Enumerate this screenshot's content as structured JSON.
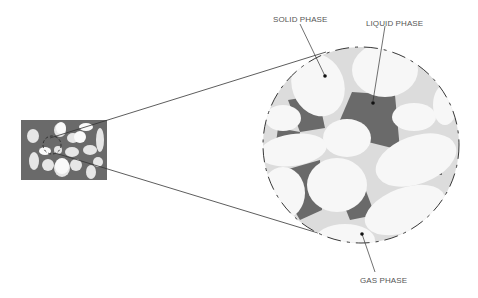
{
  "labels": {
    "solid": "SOLID PHASE",
    "liquid": "LIQUID PHASE",
    "gas": "GAS PHASE"
  },
  "colors": {
    "background": "#ffffff",
    "liquid": "#6a6a6a",
    "gas": "#dcdcdc",
    "solid": "#f7f7f7",
    "line": "#333333"
  }
}
